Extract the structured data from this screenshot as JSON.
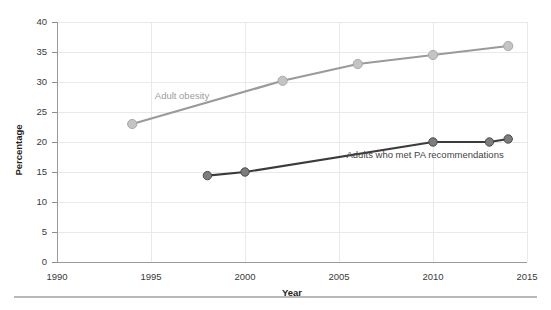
{
  "chart_data": {
    "type": "line",
    "title": "",
    "subtitle": "",
    "xlabel": "Year",
    "ylabel": "Percentage",
    "xlim": [
      1990,
      2015
    ],
    "ylim": [
      0,
      40
    ],
    "x_ticks": [
      1990,
      1995,
      2000,
      2005,
      2010,
      2015
    ],
    "x_tick_labels": [
      "1990",
      "1995",
      "2000",
      "2005",
      "2010",
      "2015"
    ],
    "y_ticks": [
      0,
      5,
      10,
      15,
      20,
      25,
      30,
      35,
      40
    ],
    "y_tick_labels": [
      "0",
      "5",
      "10",
      "15",
      "20",
      "25",
      "30",
      "35",
      "40"
    ],
    "grid": true,
    "grid_axis": "both",
    "legend": "inline-annotations",
    "series": [
      {
        "name": "Adult obesity",
        "color": "#9a9a9a",
        "marker_color": "#c4c4c4",
        "label_position": {
          "x": 1995.2,
          "y": 27.2
        },
        "points": [
          {
            "x": 1994,
            "y": 23.0
          },
          {
            "x": 2002,
            "y": 30.2
          },
          {
            "x": 2006,
            "y": 33.0
          },
          {
            "x": 2010,
            "y": 34.5
          },
          {
            "x": 2014,
            "y": 36.0
          }
        ]
      },
      {
        "name": "Adults who met PA recommendations",
        "color": "#3b3b3b",
        "marker_color": "#7d7d7d",
        "label_position": {
          "x": 2005.4,
          "y": 17.4
        },
        "points": [
          {
            "x": 1998,
            "y": 14.4
          },
          {
            "x": 2000,
            "y": 15.0
          },
          {
            "x": 2010,
            "y": 20.0
          },
          {
            "x": 2013,
            "y": 20.0
          },
          {
            "x": 2014,
            "y": 20.5
          }
        ]
      }
    ]
  },
  "colors": {
    "obesity_line": "#9a9a9a",
    "pa_line": "#3b3b3b",
    "gridline": "#e9e9e9",
    "axis": "#9a9a9a",
    "text": "#231f20",
    "footer_rule": "#b9b9b9"
  },
  "axis": {
    "y_title": "Percentage",
    "x_title": "Year"
  }
}
